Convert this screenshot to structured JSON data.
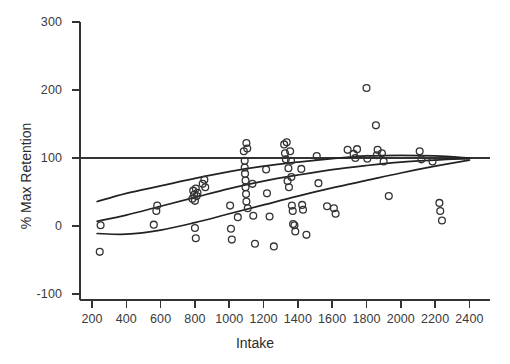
{
  "chart_data": {
    "type": "scatter",
    "title": "",
    "xlabel": "Intake",
    "ylabel": "% Max Retention",
    "xlim": [
      130,
      2520
    ],
    "ylim": [
      -130,
      315
    ],
    "grid": false,
    "legend": null,
    "x_ticks": [
      200,
      400,
      600,
      800,
      1000,
      1200,
      1400,
      1600,
      1800,
      2000,
      2200,
      2400
    ],
    "y_ticks": [
      -100,
      0,
      100,
      200,
      300
    ],
    "x_tick_labels": [
      "200",
      "400",
      "600",
      "800",
      "1000",
      "1200",
      "1400",
      "1600",
      "1800",
      "2000",
      "2200",
      "2400"
    ],
    "y_tick_labels": [
      "-100",
      "0",
      "100",
      "200",
      "300"
    ],
    "marker": {
      "shape": "open-circle",
      "radius": 3.4,
      "edge_color": "#333333",
      "face_color": "none"
    },
    "reference_lines": [
      {
        "name": "max-retention-reference",
        "orientation": "horizontal",
        "y": 100,
        "color": "#333333"
      }
    ],
    "fitted_curves": [
      {
        "name": "upper-curve",
        "color": "#222222",
        "points": [
          [
            230,
            36
          ],
          [
            400,
            48
          ],
          [
            600,
            59
          ],
          [
            800,
            70
          ],
          [
            1000,
            80
          ],
          [
            1200,
            88
          ],
          [
            1400,
            94
          ],
          [
            1600,
            99
          ],
          [
            1800,
            103
          ],
          [
            2000,
            104
          ],
          [
            2200,
            103
          ],
          [
            2400,
            100
          ]
        ]
      },
      {
        "name": "middle-curve",
        "color": "#222222",
        "points": [
          [
            230,
            7
          ],
          [
            400,
            16
          ],
          [
            600,
            29
          ],
          [
            800,
            42
          ],
          [
            1000,
            55
          ],
          [
            1200,
            66
          ],
          [
            1400,
            75
          ],
          [
            1600,
            83
          ],
          [
            1800,
            89
          ],
          [
            2000,
            94
          ],
          [
            2200,
            97
          ],
          [
            2400,
            99
          ]
        ]
      },
      {
        "name": "lower-curve",
        "color": "#222222",
        "points": [
          [
            230,
            -11
          ],
          [
            400,
            -12
          ],
          [
            600,
            -6
          ],
          [
            800,
            5
          ],
          [
            1000,
            18
          ],
          [
            1200,
            31
          ],
          [
            1400,
            44
          ],
          [
            1600,
            56
          ],
          [
            1800,
            67
          ],
          [
            2000,
            78
          ],
          [
            2200,
            88
          ],
          [
            2400,
            97
          ]
        ]
      }
    ],
    "points": [
      [
        245,
        -38
      ],
      [
        250,
        1
      ],
      [
        560,
        2
      ],
      [
        575,
        22
      ],
      [
        580,
        30
      ],
      [
        785,
        40
      ],
      [
        790,
        52
      ],
      [
        795,
        46
      ],
      [
        800,
        37
      ],
      [
        805,
        55
      ],
      [
        800,
        -3
      ],
      [
        805,
        -18
      ],
      [
        810,
        44
      ],
      [
        815,
        49
      ],
      [
        845,
        62
      ],
      [
        855,
        68
      ],
      [
        860,
        57
      ],
      [
        1005,
        30
      ],
      [
        1010,
        -4
      ],
      [
        1015,
        -20
      ],
      [
        1050,
        13
      ],
      [
        1085,
        110
      ],
      [
        1090,
        96
      ],
      [
        1090,
        86
      ],
      [
        1092,
        77
      ],
      [
        1095,
        67
      ],
      [
        1095,
        57
      ],
      [
        1098,
        47
      ],
      [
        1100,
        36
      ],
      [
        1100,
        122
      ],
      [
        1105,
        114
      ],
      [
        1108,
        26
      ],
      [
        1135,
        62
      ],
      [
        1140,
        15
      ],
      [
        1150,
        -26
      ],
      [
        1215,
        83
      ],
      [
        1220,
        48
      ],
      [
        1235,
        14
      ],
      [
        1260,
        -30
      ],
      [
        1320,
        120
      ],
      [
        1325,
        107
      ],
      [
        1330,
        98
      ],
      [
        1335,
        123
      ],
      [
        1340,
        66
      ],
      [
        1345,
        85
      ],
      [
        1348,
        57
      ],
      [
        1355,
        110
      ],
      [
        1360,
        96
      ],
      [
        1362,
        72
      ],
      [
        1365,
        30
      ],
      [
        1370,
        22
      ],
      [
        1372,
        3
      ],
      [
        1380,
        1
      ],
      [
        1385,
        -8
      ],
      [
        1420,
        84
      ],
      [
        1425,
        31
      ],
      [
        1430,
        24
      ],
      [
        1450,
        -13
      ],
      [
        1510,
        103
      ],
      [
        1520,
        63
      ],
      [
        1570,
        29
      ],
      [
        1610,
        26
      ],
      [
        1620,
        18
      ],
      [
        1690,
        112
      ],
      [
        1725,
        106
      ],
      [
        1735,
        100
      ],
      [
        1745,
        113
      ],
      [
        1800,
        203
      ],
      [
        1805,
        99
      ],
      [
        1855,
        148
      ],
      [
        1860,
        104
      ],
      [
        1865,
        112
      ],
      [
        1890,
        107
      ],
      [
        1900,
        95
      ],
      [
        1930,
        44
      ],
      [
        2110,
        110
      ],
      [
        2120,
        98
      ],
      [
        2185,
        95
      ],
      [
        2225,
        34
      ],
      [
        2230,
        22
      ],
      [
        2240,
        8
      ]
    ]
  }
}
